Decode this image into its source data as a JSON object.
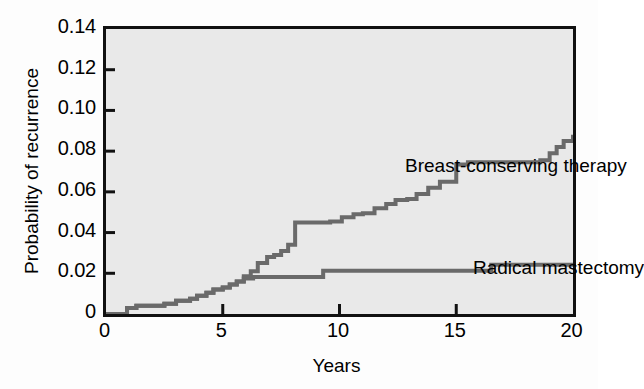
{
  "chart_data": {
    "type": "line",
    "title": "",
    "xlabel": "Years",
    "ylabel": "Probability of recurrence",
    "xlim": [
      0,
      20
    ],
    "ylim": [
      0,
      0.14
    ],
    "xticks": [
      "0",
      "5",
      "10",
      "15",
      "20"
    ],
    "xtick_values": [
      0,
      5,
      10,
      15,
      20
    ],
    "yticks": [
      "0",
      "0.02",
      "0.04",
      "0.06",
      "0.08",
      "0.10",
      "0.12",
      "0.14"
    ],
    "ytick_values": [
      0,
      0.02,
      0.04,
      0.06,
      0.08,
      0.1,
      0.12,
      0.14
    ],
    "grid": false,
    "legend": "in-plot annotations",
    "line_color": "#6a6a6a",
    "plot_background": "#e9e9e9",
    "frame_color": "#111111",
    "step_type": "post",
    "series": [
      {
        "name": "Breast-conserving therapy",
        "annotation_text": "Breast-conserving therapy",
        "x": [
          0,
          0.9,
          1.3,
          2.5,
          3.0,
          3.6,
          3.9,
          4.3,
          4.6,
          5.0,
          5.3,
          5.6,
          5.9,
          6.2,
          6.5,
          6.9,
          7.2,
          7.5,
          7.8,
          8.1,
          9.6,
          10.1,
          10.6,
          11.0,
          11.5,
          12.0,
          12.4,
          12.9,
          13.3,
          13.8,
          14.3,
          15.0,
          15.5,
          18.6,
          19.0,
          19.3,
          19.6,
          20.0
        ],
        "values": [
          0,
          0.003,
          0.004,
          0.005,
          0.0065,
          0.0075,
          0.009,
          0.0105,
          0.012,
          0.013,
          0.0145,
          0.016,
          0.0185,
          0.021,
          0.025,
          0.028,
          0.029,
          0.031,
          0.034,
          0.045,
          0.0455,
          0.0475,
          0.049,
          0.0495,
          0.052,
          0.054,
          0.056,
          0.0565,
          0.059,
          0.062,
          0.065,
          0.0735,
          0.0745,
          0.0755,
          0.079,
          0.082,
          0.085,
          0.088
        ]
      },
      {
        "name": "Radical mastectomy",
        "annotation_text": "Radical mastectomy",
        "x": [
          0,
          0.9,
          1.3,
          2.5,
          3.0,
          3.6,
          3.9,
          4.3,
          4.6,
          5.0,
          5.3,
          5.6,
          5.9,
          6.3,
          9.3,
          16.5,
          20.0
        ],
        "values": [
          0,
          0.003,
          0.004,
          0.005,
          0.0065,
          0.0075,
          0.009,
          0.0105,
          0.012,
          0.013,
          0.0145,
          0.016,
          0.0175,
          0.0182,
          0.0212,
          0.0242,
          0.0242
        ]
      }
    ]
  },
  "axes": {
    "x_title": "Years",
    "y_title": "Probability of recurrence"
  }
}
